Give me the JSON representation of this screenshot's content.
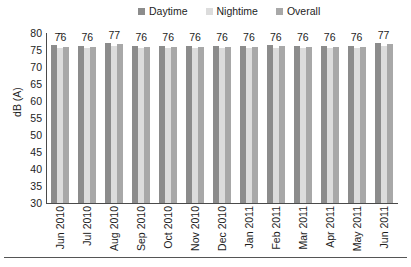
{
  "chart_data": {
    "type": "bar",
    "title": "",
    "xlabel": "",
    "ylabel": "dB (A)",
    "ylim": [
      30,
      80
    ],
    "yticks": [
      80,
      75,
      70,
      65,
      60,
      55,
      50,
      45,
      40,
      35,
      30
    ],
    "grid": false,
    "legend_position": "top-center",
    "categories": [
      "Jun 2010",
      "Jul 2010",
      "Aug 2010",
      "Sep 2010",
      "Oct 2010",
      "Nov 2010",
      "Dec 2010",
      "Jan 2011",
      "Feb 2011",
      "Mar 2011",
      "Apr 2011",
      "May 2011",
      "Jun 2011"
    ],
    "series": [
      {
        "name": "Daytime",
        "color": "#8c8c8c",
        "values": [
          76.4,
          76.2,
          77.0,
          76.3,
          76.3,
          76.2,
          76.3,
          76.3,
          76.4,
          76.3,
          76.2,
          76.2,
          77.0
        ]
      },
      {
        "name": "Nightime",
        "color": "#dcdcdc",
        "values": [
          75.6,
          75.6,
          76.2,
          75.6,
          75.5,
          75.6,
          75.6,
          75.6,
          75.7,
          75.6,
          75.5,
          75.6,
          76.3
        ]
      },
      {
        "name": "Overall",
        "color": "#a8a8a8",
        "values": [
          76.0,
          76.0,
          76.8,
          76.0,
          76.0,
          76.0,
          76.0,
          76.0,
          76.1,
          76.0,
          76.0,
          76.0,
          76.8
        ]
      }
    ],
    "data_labels": [
      "76",
      "76",
      "77",
      "76",
      "76",
      "76",
      "76",
      "76",
      "76",
      "76",
      "76",
      "76",
      "77"
    ]
  },
  "legend": {
    "items": [
      {
        "label": "Daytime",
        "color": "#8c8c8c"
      },
      {
        "label": "Nightime",
        "color": "#dcdcdc"
      },
      {
        "label": "Overall",
        "color": "#a8a8a8"
      }
    ]
  },
  "axes": {
    "y_title": "dB (A)"
  }
}
